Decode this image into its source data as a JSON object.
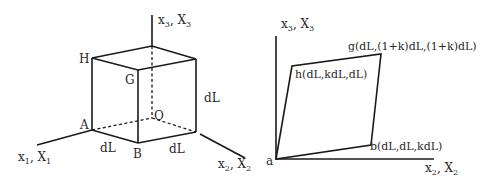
{
  "left_figure": {
    "name": "undeformed-cube",
    "axes": {
      "x1": {
        "main": "x",
        "sub": "1",
        "main2": "X",
        "sub2": "1"
      },
      "x2": {
        "main": "x",
        "sub": "2",
        "main2": "X",
        "sub2": "2"
      },
      "x3": {
        "main": "x",
        "sub": "3",
        "main2": "X",
        "sub2": "3"
      }
    },
    "vertices": {
      "H": "H",
      "G": "G",
      "A": "A",
      "B": "B",
      "O": "O"
    },
    "edge_labels": {
      "front_bottom": "dL",
      "right_bottom": "dL",
      "right_vertical": "dL"
    }
  },
  "right_figure": {
    "name": "deformed-face",
    "axes": {
      "vertical": {
        "main": "x",
        "sub": "3",
        "main2": "X",
        "sub2": "3"
      },
      "horizontal": {
        "main": "x",
        "sub": "2",
        "main2": "X",
        "sub2": "2"
      }
    },
    "vertices": {
      "a": "a",
      "b": "b(dL,dL,kdL)",
      "g": "g(dL,(1+k)dL,(1+k)dL)",
      "h": "h(dL,kdL,dL)"
    }
  },
  "colors": {
    "line": "#1a1a1a",
    "text": "#2a2a2a",
    "background": "#ffffff"
  }
}
